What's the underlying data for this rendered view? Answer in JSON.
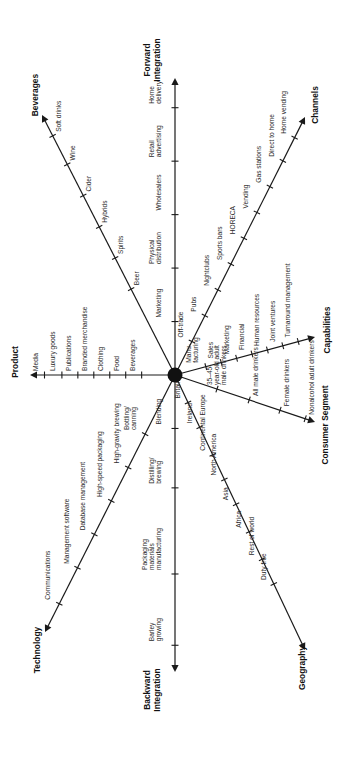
{
  "diagram": {
    "type": "radial-strategy-axes",
    "orientation": "rotated-90-ccw",
    "center_label": "",
    "axes": [
      {
        "id": "forward-integration",
        "title": [
          "Forward",
          "Integration"
        ],
        "ticks": [
          [
            "Marketing"
          ],
          [
            "Physical",
            "distribution"
          ],
          [
            "Wholesalers"
          ],
          [
            "Retail",
            "advertising"
          ],
          [
            "Home",
            "delivery"
          ]
        ]
      },
      {
        "id": "beverages",
        "title": [
          "Beverages"
        ],
        "ticks": [
          [
            "Beer"
          ],
          [
            "Spirits"
          ],
          [
            "Hybrids"
          ],
          [
            "Cider"
          ],
          [
            "Wine"
          ],
          [
            "Soft drinks"
          ]
        ]
      },
      {
        "id": "channels",
        "title": [
          "Channels"
        ],
        "ticks": [
          [
            "Off-trade"
          ],
          [
            "Pubs"
          ],
          [
            "Nightclubs"
          ],
          [
            "Sports bars"
          ],
          [
            "HORECA"
          ],
          [
            "Vending"
          ],
          [
            "Gas stations"
          ],
          [
            "Direct to home"
          ],
          [
            "Home vending"
          ]
        ]
      },
      {
        "id": "product",
        "title": [
          "Product"
        ],
        "ticks": [
          [
            "Beverages"
          ],
          [
            "Food"
          ],
          [
            "Clothing"
          ],
          [
            "Branded merchandise"
          ],
          [
            "Publications"
          ],
          [
            "Luxury goods"
          ],
          [
            "Media"
          ]
        ]
      },
      {
        "id": "capabilities",
        "title": [
          "Capabilities"
        ],
        "ticks": [
          [
            "Manu-",
            "facturing"
          ],
          [
            "Sales"
          ],
          [
            "Marketing"
          ],
          [
            "Financial"
          ],
          [
            "Human resources"
          ],
          [
            "Joint ventures"
          ],
          [
            "Turnaround management"
          ]
        ]
      },
      {
        "id": "consumer-segment",
        "title": [
          "Consumer Segment"
        ],
        "ticks": [
          [
            "35–45-",
            "year-old adult",
            "male drinkers"
          ],
          [
            "All male drinkers"
          ],
          [
            "Female drinkers"
          ],
          [
            "Nonalcohol adult drinkers"
          ]
        ]
      },
      {
        "id": "technology",
        "title": [
          "Technology"
        ],
        "ticks": [
          [
            "Bottling/",
            "canning"
          ],
          [
            "High-gravity brewing"
          ],
          [
            "High-speed packaging"
          ],
          [
            "Database management"
          ],
          [
            "Management software"
          ],
          [
            "Communications"
          ]
        ]
      },
      {
        "id": "backward-integration",
        "title": [
          "Backward",
          "Integration"
        ],
        "ticks": [
          [
            "Blending"
          ],
          [
            "Distilling/",
            "brewing"
          ],
          [
            "Packaging",
            "materials",
            "manufacturing"
          ],
          [
            "Barley",
            "growing"
          ]
        ]
      },
      {
        "id": "geography",
        "title": [
          "Geography"
        ],
        "ticks": [
          [
            "Britain"
          ],
          [
            "Ireland"
          ],
          [
            "Continental Europe"
          ],
          [
            "North America"
          ],
          [
            "Asia"
          ],
          [
            "Africa"
          ],
          [
            "Rest of world"
          ],
          [
            "Duty free"
          ]
        ]
      }
    ]
  },
  "colors": {
    "line": "#1a1a1a",
    "text": "#2a2a2a",
    "background": "#ffffff"
  }
}
